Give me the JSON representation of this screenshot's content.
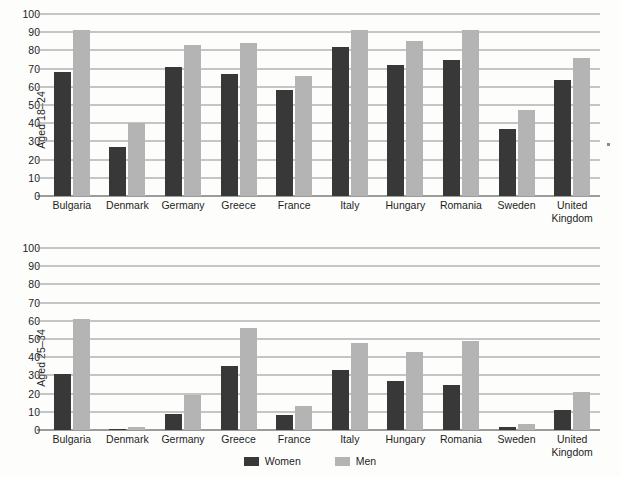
{
  "legend": {
    "items": [
      {
        "label": "Women",
        "color": "#383838",
        "icon": "legend-swatch-icon"
      },
      {
        "label": "Men",
        "color": "#b4b4b4",
        "icon": "legend-swatch-icon"
      }
    ]
  },
  "colors": {
    "women": "#383838",
    "men": "#b4b4b4",
    "gridline": "#8e8e8e",
    "axis": "#3c3c3c",
    "background": "#fdfdfc",
    "text": "#1d1d1d"
  },
  "chart_data": [
    {
      "type": "bar",
      "title": "",
      "xlabel": "",
      "ylabel": "Aged 18–24",
      "ylim": [
        0,
        100
      ],
      "yticks": [
        0,
        10,
        20,
        30,
        40,
        50,
        60,
        70,
        80,
        90,
        100
      ],
      "grid": true,
      "legend_position": "bottom-center",
      "categories": [
        "Bulgaria",
        "Denmark",
        "Germany",
        "Greece",
        "France",
        "Italy",
        "Hungary",
        "Romania",
        "Sweden",
        "United Kingdom"
      ],
      "series": [
        {
          "name": "Women",
          "values": [
            68,
            27,
            71,
            67,
            58,
            82,
            72,
            75,
            37,
            64
          ]
        },
        {
          "name": "Men",
          "values": [
            91,
            40,
            83,
            84,
            66,
            91,
            85,
            91,
            47,
            76
          ]
        }
      ]
    },
    {
      "type": "bar",
      "title": "",
      "xlabel": "",
      "ylabel": "Aged 25–34",
      "ylim": [
        0,
        100
      ],
      "yticks": [
        0,
        10,
        20,
        30,
        40,
        50,
        60,
        70,
        80,
        90,
        100
      ],
      "grid": true,
      "legend_position": "bottom-center",
      "categories": [
        "Bulgaria",
        "Denmark",
        "Germany",
        "Greece",
        "France",
        "Italy",
        "Hungary",
        "Romania",
        "Sweden",
        "United Kingdom"
      ],
      "series": [
        {
          "name": "Women",
          "values": [
            31,
            0.5,
            9,
            35,
            8,
            33,
            27,
            25,
            1.5,
            11
          ]
        },
        {
          "name": "Men",
          "values": [
            61,
            1.5,
            19,
            56,
            13,
            48,
            43,
            49,
            3.5,
            21
          ]
        }
      ]
    }
  ]
}
